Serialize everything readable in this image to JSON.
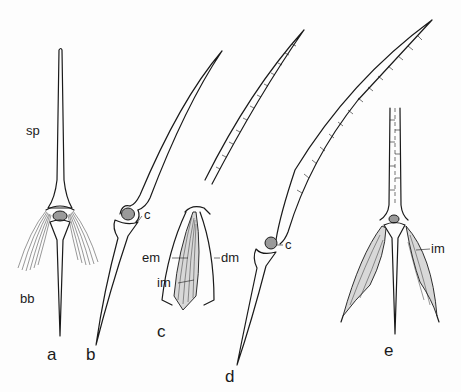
{
  "figure": {
    "panels": [
      {
        "id": "a",
        "label": "a",
        "annotations": [
          {
            "key": "sp",
            "text": "sp"
          },
          {
            "key": "bb",
            "text": "bb"
          }
        ]
      },
      {
        "id": "b",
        "label": "b",
        "annotations": [
          {
            "key": "c",
            "text": "c"
          }
        ]
      },
      {
        "id": "c",
        "label": "c",
        "annotations": [
          {
            "key": "em",
            "text": "em"
          },
          {
            "key": "dm",
            "text": "dm"
          },
          {
            "key": "im",
            "text": "im"
          }
        ]
      },
      {
        "id": "d",
        "label": "d",
        "annotations": [
          {
            "key": "c",
            "text": "c"
          }
        ]
      },
      {
        "id": "e",
        "label": "e",
        "annotations": [
          {
            "key": "im",
            "text": "im"
          }
        ]
      }
    ]
  },
  "colors": {
    "ink": "#1a1a1a",
    "background": "#fdfdfd",
    "muscle_fill": "#d8d8d8",
    "condyle_fill": "#9a9a9a"
  }
}
